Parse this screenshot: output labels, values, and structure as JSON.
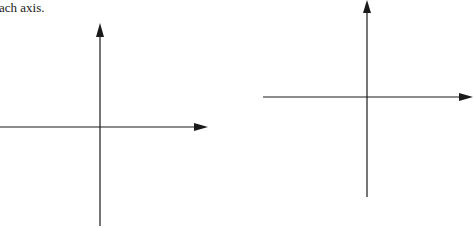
{
  "caption": {
    "text": "ach axis."
  },
  "colors": {
    "axis": "#1a1a1a",
    "background": "#ffffff"
  },
  "diagrams": [
    {
      "name": "left-coordinate-axes",
      "origin": [
        100,
        127
      ],
      "x_axis": {
        "from": 0,
        "to": 208
      },
      "y_axis": {
        "from": 23,
        "to": 226
      }
    },
    {
      "name": "right-coordinate-axes",
      "origin": [
        367,
        97
      ],
      "x_axis": {
        "from": 263,
        "to": 473
      },
      "y_axis": {
        "from": 0,
        "to": 197
      }
    }
  ]
}
